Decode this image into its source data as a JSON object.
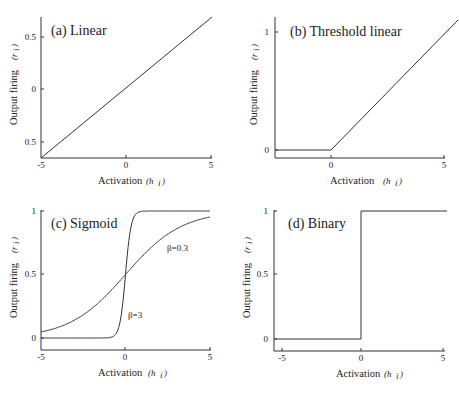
{
  "chart_data": [
    {
      "type": "line",
      "title": "(a) Linear",
      "xlabel": "Activation",
      "xlabel_sym": "(h_i)",
      "ylabel": "Output firing",
      "ylabel_sym": "(r_i)",
      "xlim": [
        -5,
        5
      ],
      "x_ticks": [
        "-5",
        "0",
        "5"
      ],
      "y_ticks": [
        "0.5",
        "0",
        "0.5"
      ],
      "series": [
        {
          "name": "linear",
          "x": [
            -5,
            5
          ],
          "y": [
            -0.6,
            0.6
          ]
        }
      ]
    },
    {
      "type": "line",
      "title": "(b) Threshold linear",
      "xlabel": "Activation",
      "xlabel_sym": "(h_i)",
      "ylabel": "Output firing",
      "ylabel_sym": "(r_i)",
      "xlim": [
        -3,
        5
      ],
      "x_ticks": [
        "0",
        "5"
      ],
      "y_ticks": [
        "0",
        "1"
      ],
      "series": [
        {
          "name": "threshold linear",
          "x": [
            -3,
            0,
            5
          ],
          "y": [
            0,
            0,
            1.1
          ]
        }
      ]
    },
    {
      "type": "line",
      "title": "(c) Sigmoid",
      "xlabel": "Activation",
      "xlabel_sym": "(h_i)",
      "ylabel": "Output firing",
      "ylabel_sym": "(r_i)",
      "xlim": [
        -5,
        5
      ],
      "ylim": [
        0,
        1
      ],
      "x_ticks": [
        "-5",
        "0",
        "5"
      ],
      "y_ticks": [
        "0",
        "0.5",
        "1"
      ],
      "series": [
        {
          "name": "β=0.3",
          "beta": 0.3
        },
        {
          "name": "β=3",
          "beta": 3
        }
      ],
      "annotations": [
        "β=0.3",
        "β=3"
      ]
    },
    {
      "type": "line",
      "title": "(d) Binary",
      "xlabel": "Activation",
      "xlabel_sym": "(h_i)",
      "ylabel": "Output firing",
      "ylabel_sym": "(r_i)",
      "xlim": [
        -5,
        5
      ],
      "ylim": [
        0,
        1
      ],
      "x_ticks": [
        "-5",
        "0",
        "5"
      ],
      "y_ticks": [
        "0",
        "0.5",
        "1"
      ],
      "series": [
        {
          "name": "binary",
          "x": [
            -5,
            0,
            0,
            5
          ],
          "y": [
            0,
            0,
            1,
            1
          ]
        }
      ]
    }
  ],
  "labels": {
    "a": {
      "title": "(a) Linear",
      "xt": [
        "-5",
        "0",
        "5"
      ],
      "yt": [
        "0.5",
        "0",
        "0.5"
      ]
    },
    "b": {
      "title": "(b) Threshold linear",
      "xt": [
        "0",
        "5"
      ],
      "yt": [
        "0",
        "1"
      ]
    },
    "c": {
      "title": "(c) Sigmoid",
      "xt": [
        "-5",
        "0",
        "5"
      ],
      "yt": [
        "0",
        "0.5",
        "1"
      ],
      "ann1": "β=0.3",
      "ann2": "β=3"
    },
    "d": {
      "title": "(d) Binary",
      "xt": [
        "-5",
        "0",
        "5"
      ],
      "yt": [
        "0",
        "0.5",
        "1"
      ]
    },
    "xlabel": "Activation",
    "xsym": "(h",
    "xsub": "i",
    "ylabel": "Output firing",
    "ysym": "(r",
    "ysub": "i",
    "close": ")"
  }
}
